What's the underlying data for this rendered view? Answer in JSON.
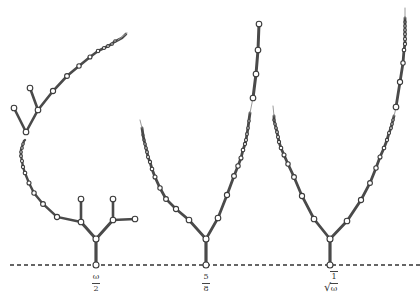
{
  "diagram": {
    "type": "tree-sequence",
    "colors": {
      "edge": "#4a4a4a",
      "node_fill": "#ffffff",
      "node_stroke": "#3a3a3a",
      "baseline": "#333333",
      "background": "#ffffff"
    },
    "baseline_y": 265,
    "trees": [
      {
        "id": "tree-omega-half",
        "label": {
          "type": "fraction",
          "numerator": "ω",
          "denominator": "2"
        },
        "root_x": 96,
        "shape": "spiral with side branches"
      },
      {
        "id": "tree-five-eighths",
        "label": {
          "type": "fraction",
          "numerator": "5",
          "denominator": "8"
        },
        "root_x": 206,
        "shape": "V-shaped two-armed tree"
      },
      {
        "id": "tree-sqrt-inv-omega",
        "label": {
          "type": "sqrt-fraction",
          "radical": "√",
          "numerator": "1",
          "denominator": "ω"
        },
        "root_x": 330,
        "shape": "V-shaped two-armed tree"
      }
    ]
  }
}
